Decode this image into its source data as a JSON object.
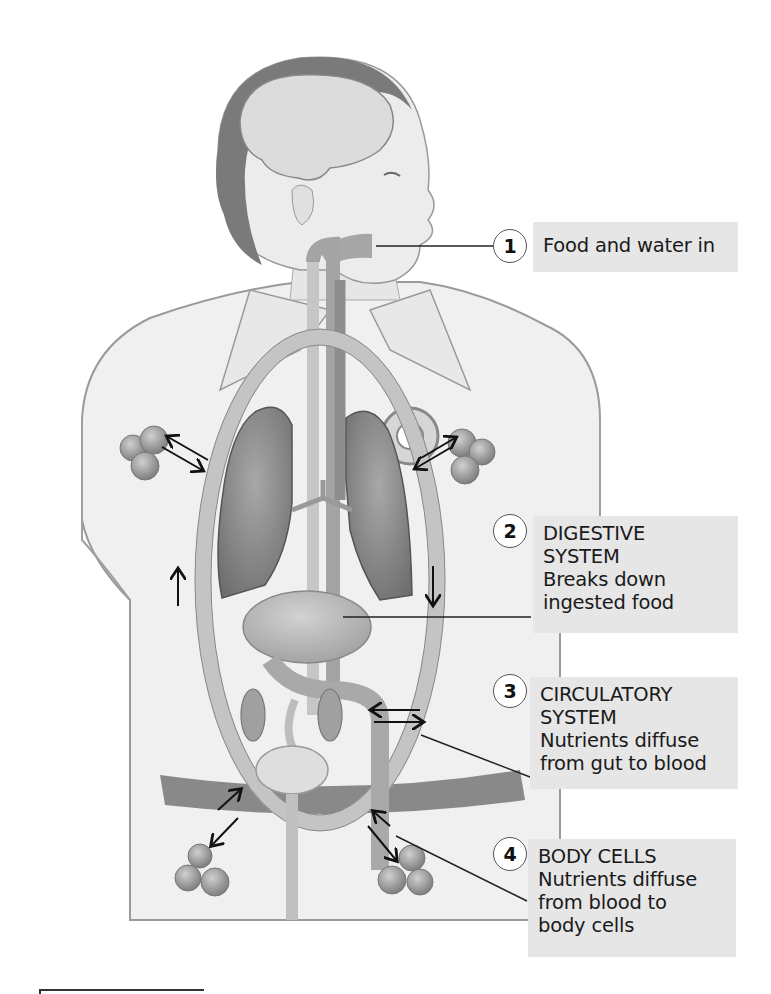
{
  "figure": {
    "colors": {
      "label_box": "#e6e6e6",
      "organ_fill": "#9a9a9a",
      "vessel_fill": "#c4c4c4",
      "skin": "#ececec",
      "hair": "#7a7a7a",
      "arrow": "#111111"
    }
  },
  "callouts": [
    {
      "number": "1",
      "lines": [
        "Food and water in"
      ]
    },
    {
      "number": "2",
      "lines": [
        "DIGESTIVE",
        "SYSTEM",
        "Breaks down",
        "ingested food"
      ]
    },
    {
      "number": "3",
      "lines": [
        "CIRCULATORY",
        "SYSTEM",
        "Nutrients diffuse",
        "from gut to blood"
      ]
    },
    {
      "number": "4",
      "lines": [
        "BODY CELLS",
        "Nutrients diffuse",
        "from blood to",
        "body cells"
      ]
    }
  ],
  "icons": {
    "flow_up": "arrow-up",
    "flow_down": "arrow-down",
    "exchange": "double-arrow"
  }
}
